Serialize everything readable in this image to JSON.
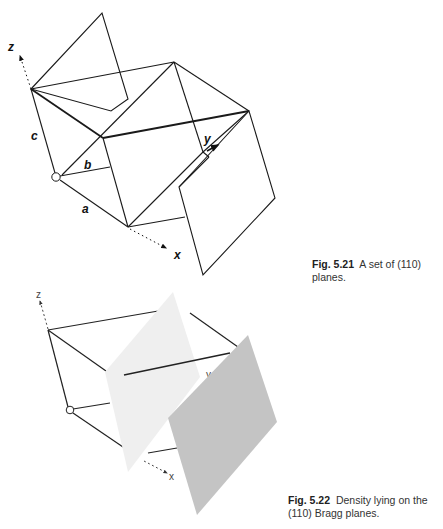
{
  "figure_1": {
    "number": "Fig. 5.21",
    "caption": "A set of (110) planes.",
    "axis_labels": {
      "z": "z",
      "y": "y",
      "x": "x"
    },
    "edge_labels": {
      "a": "a",
      "b": "b",
      "c": "c"
    },
    "colors": {
      "line": "#1a1a1a",
      "plane_fill": "#ffffff"
    }
  },
  "figure_2": {
    "number": "Fig. 5.22",
    "caption_line1": "Density lying on the",
    "caption_line2": "(110) Bragg planes.",
    "axis_labels": {
      "z": "z",
      "y": "y",
      "x": "x"
    },
    "colors": {
      "line": "#222222",
      "light_plane": "#efefef",
      "dark_plane": "#c4c4c4"
    }
  }
}
